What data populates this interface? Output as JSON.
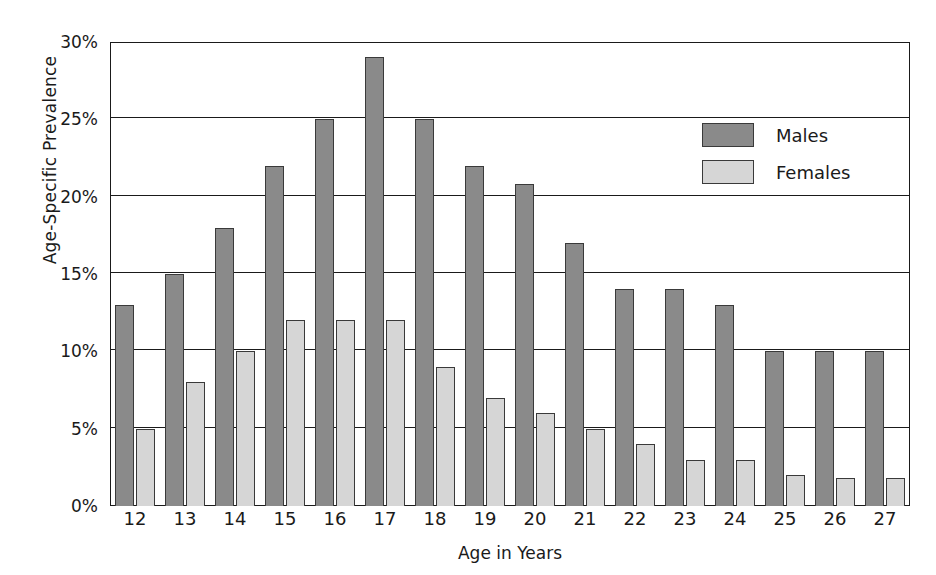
{
  "chart_data": {
    "type": "bar",
    "title": "",
    "xlabel": "Age in Years",
    "ylabel": "Age-Specific Prevalence",
    "categories": [
      "12",
      "13",
      "14",
      "15",
      "16",
      "17",
      "18",
      "19",
      "20",
      "21",
      "22",
      "23",
      "24",
      "25",
      "26",
      "27"
    ],
    "series": [
      {
        "name": "Males",
        "color": "#8a8a8a",
        "values": [
          13,
          15,
          18,
          22,
          25,
          29,
          25,
          22,
          20.8,
          17,
          14,
          14,
          13,
          10,
          10,
          10
        ]
      },
      {
        "name": "Females",
        "color": "#d6d6d6",
        "values": [
          5,
          8,
          10,
          12,
          12,
          12,
          9,
          7,
          6,
          5,
          4,
          3,
          3,
          2,
          1.8,
          1.8
        ]
      }
    ],
    "ylim": [
      0,
      30
    ],
    "ytick_values": [
      0,
      5,
      10,
      15,
      20,
      25,
      30
    ],
    "ytick_labels": [
      "0%",
      "5%",
      "10%",
      "15%",
      "20%",
      "25%",
      "30%"
    ],
    "grid": true,
    "grid_axis": "y",
    "legend_position": "top-right",
    "legend_entries": [
      "Males",
      "Females"
    ],
    "value_unit": "%"
  }
}
